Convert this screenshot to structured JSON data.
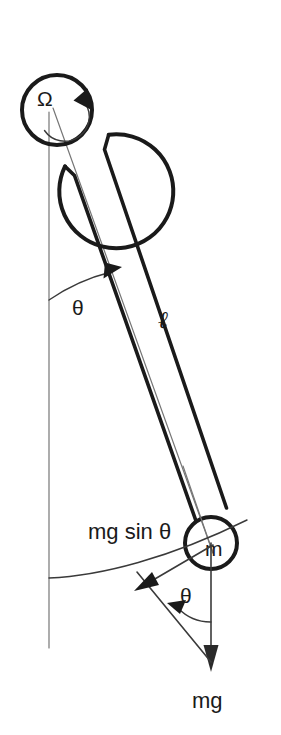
{
  "figure": {
    "kind": "physics-free-body-diagram",
    "background_color": "#ffffff",
    "ink_color": "#1a1a1a",
    "thin_line_color": "#767676"
  },
  "labels": {
    "omega": "Ω",
    "theta_top": "θ",
    "theta_bottom": "θ",
    "length": "ℓ",
    "mass": "m",
    "weight": "mg",
    "tangential_force": "mg sin θ"
  },
  "icons": {
    "rotation_arrow": "rotation-arrow-icon",
    "angle_arc_top": "angle-arc-icon",
    "angle_arc_bottom": "angle-arc-icon",
    "swing_arc": "swing-path-arc-icon",
    "weight_vector": "down-arrow-icon",
    "tangential_vector": "diagonal-arrow-icon"
  },
  "geometry": {
    "pivot_center": {
      "x": 57,
      "y": 110
    },
    "pivot_outer_radius": 57,
    "pivot_inner_radius": 35,
    "bob_center": {
      "x": 211,
      "y": 543
    },
    "bob_radius": 26,
    "vertical_line": {
      "x": 49,
      "y_top": 110,
      "y_bottom": 648
    },
    "rod_angle_degrees": 20
  }
}
